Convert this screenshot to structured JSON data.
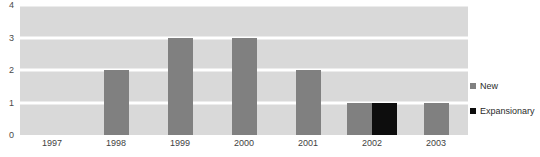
{
  "chart_data": {
    "type": "bar",
    "title": "",
    "subtitle": "",
    "xlabel": "",
    "ylabel": "",
    "categories": [
      "1997",
      "1998",
      "1999",
      "2000",
      "2001",
      "2002",
      "2003"
    ],
    "series": [
      {
        "name": "New",
        "color": "#808080",
        "values": [
          0,
          2,
          3,
          3,
          2,
          1,
          1
        ]
      },
      {
        "name": "Expansionary",
        "color": "#0d0d0d",
        "values": [
          0,
          0,
          0,
          0,
          0,
          1,
          0
        ]
      }
    ],
    "ylim": [
      0,
      4
    ],
    "y_ticks": [
      "0",
      "1",
      "2",
      "3",
      "4"
    ],
    "grid": true,
    "grid_color": "#ffffff",
    "plot_background": "#d9d9d9",
    "legend_position": "right",
    "annotations": []
  },
  "legend": {
    "items": [
      {
        "label": "New",
        "swatch_name": "legend-swatch-new"
      },
      {
        "label": "Expansionary",
        "swatch_name": "legend-swatch-expansionary"
      }
    ]
  }
}
